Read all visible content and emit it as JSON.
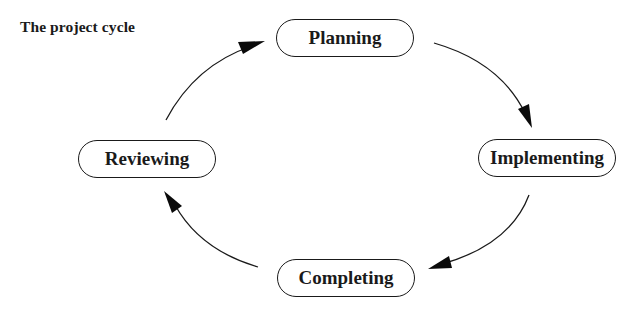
{
  "diagram": {
    "title": "The project cycle",
    "type": "cycle",
    "nodes": [
      {
        "id": "planning",
        "label": "Planning"
      },
      {
        "id": "implementing",
        "label": "Implementing"
      },
      {
        "id": "completing",
        "label": "Completing"
      },
      {
        "id": "reviewing",
        "label": "Reviewing"
      }
    ],
    "edges": [
      {
        "from": "planning",
        "to": "implementing"
      },
      {
        "from": "implementing",
        "to": "completing"
      },
      {
        "from": "completing",
        "to": "reviewing"
      },
      {
        "from": "reviewing",
        "to": "planning"
      }
    ],
    "colors": {
      "stroke": "#1a1a1a",
      "background": "#ffffff",
      "text": "#1a1a1a"
    }
  }
}
